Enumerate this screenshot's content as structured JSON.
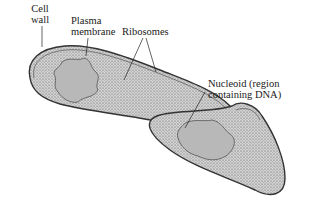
{
  "diagram": {
    "labels": {
      "cell_wall": [
        "Cell",
        "wall"
      ],
      "plasma_membrane": [
        "Plasma",
        "membrane"
      ],
      "ribosomes": "Ribosomes",
      "nucleoid": [
        "Nucleoid (region",
        "containing DNA)"
      ]
    },
    "colors": {
      "cytoplasm": "#c9c9c9",
      "nucleoid": "#b8b8b8",
      "outline": "#333333",
      "text": "#1a1a1a"
    }
  }
}
